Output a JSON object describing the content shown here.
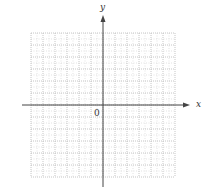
{
  "diagram": {
    "type": "coordinate-grid",
    "x_axis_label": "x",
    "y_axis_label": "y",
    "origin_label": "0",
    "grid": {
      "columns": 12,
      "rows": 12,
      "cell_px": 12,
      "left": 31,
      "top": 33,
      "right": 175,
      "bottom": 177,
      "major_color": "#b8b8b8",
      "minor_color": "#dcdcdc",
      "style": "dotted"
    },
    "axes": {
      "origin_x": 103,
      "origin_y": 105,
      "x_start": 22,
      "x_end": 190,
      "y_start": 187,
      "y_end": 15,
      "color": "#444444"
    }
  }
}
